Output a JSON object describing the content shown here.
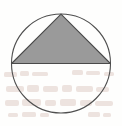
{
  "figure": {
    "title": "Circle with inscribed shaded triangle",
    "background_color": "#fefefd",
    "canvas": {
      "width": 122,
      "height": 126
    },
    "circle": {
      "name": "outer circle",
      "center_x": 61,
      "center_y": 63.5,
      "radius": 49.5,
      "stroke_color": "#4f4f4f",
      "stroke_width": 1.1,
      "fill_color": "none"
    },
    "triangle": {
      "name": "inscribed shaded triangle",
      "fill_color": "#9a9a9a",
      "stroke_color": "#4a4a4a",
      "stroke_width": 1.1,
      "vertices": [
        {
          "label": "apex",
          "x": 61,
          "y": 14.2
        },
        {
          "label": "left base",
          "x": 11.6,
          "y": 63.5
        },
        {
          "label": "right base",
          "x": 110.4,
          "y": 63.5
        }
      ]
    },
    "baseline": {
      "name": "horizontal diameter chord",
      "x1": 11.6,
      "y1": 63.5,
      "x2": 110.4,
      "y2": 63.5,
      "stroke_color": "#4a4a4a",
      "stroke_width": 1.1
    },
    "artifacts": {
      "name": "scanned paper bleed-through",
      "color": "#c9a69c",
      "visible": true,
      "note": "Faint illegible reverse-side print showing in the lower half of the image."
    }
  }
}
